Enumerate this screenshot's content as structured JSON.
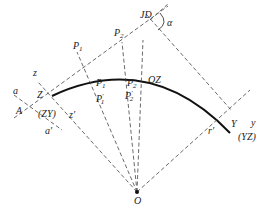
{
  "diagram": {
    "labels": {
      "JD": "JD",
      "alpha": "α",
      "P1_top": "P",
      "P1_top_sub": "1",
      "P2_top": "P",
      "P2_top_sub": "2",
      "P1_mid": "P",
      "P1_mid_sub": "1",
      "P2_mid": "P",
      "P2_mid_sub": "2",
      "P1_prime": "P",
      "P1_prime_sub": "1",
      "P1_prime_mark": "′",
      "P2_prime": "P",
      "P2_prime_sub": "2",
      "P2_prime_mark": "′",
      "QZ": "QZ",
      "z": "z",
      "Z": "Z",
      "a": "a",
      "A": "A",
      "ZY": "(ZY)",
      "z_prime": "z′",
      "a_prime": "a′",
      "Y": "Y",
      "y": "y",
      "YZ": "(YZ)",
      "r_prime": "r′",
      "O": "O"
    }
  }
}
